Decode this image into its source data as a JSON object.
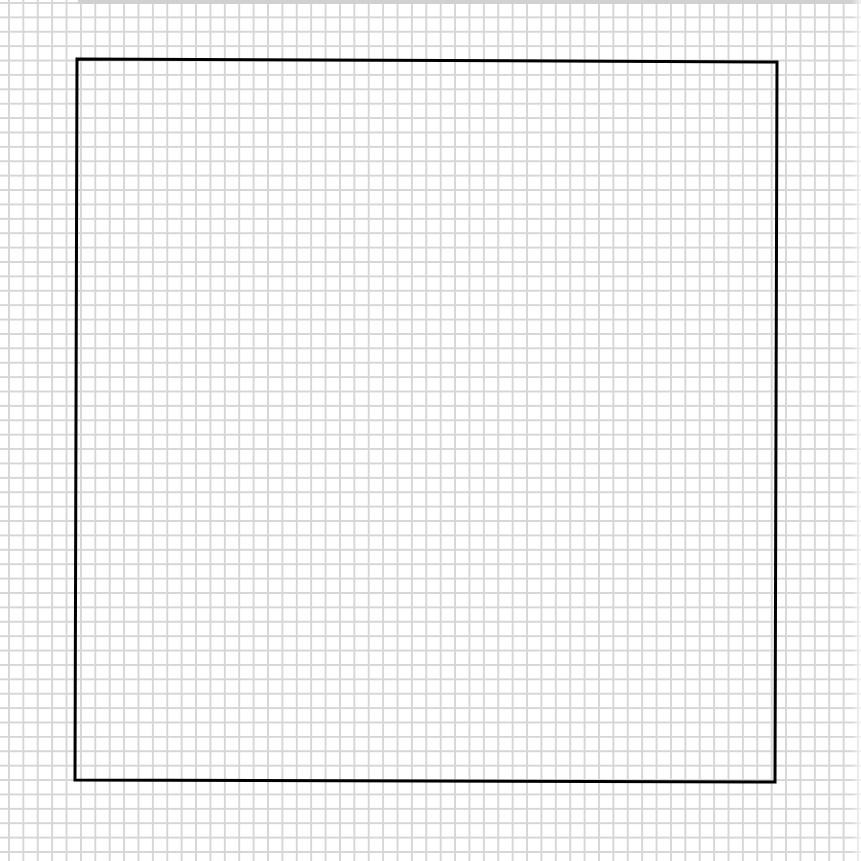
{
  "canvas": {
    "width": 861,
    "height": 861,
    "background": "#ffffff"
  },
  "grid": {
    "spacing_px": 14.4,
    "line_color": "#d6d6d6"
  },
  "shape": {
    "type": "square-outline",
    "stroke": "#000000",
    "stroke_width": 3,
    "points": "77,59 777,62 775,782 75,780"
  }
}
